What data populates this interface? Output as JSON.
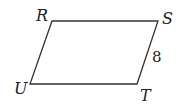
{
  "diagram": {
    "shape": "parallelogram",
    "stroke_color": "#333333",
    "vertices": [
      {
        "label": "R",
        "x": 52,
        "y": 21
      },
      {
        "label": "S",
        "x": 158,
        "y": 21
      },
      {
        "label": "T",
        "x": 137,
        "y": 84
      },
      {
        "label": "U",
        "x": 30,
        "y": 84
      }
    ],
    "side_labels": [
      {
        "side": "ST",
        "text": "8"
      }
    ]
  }
}
